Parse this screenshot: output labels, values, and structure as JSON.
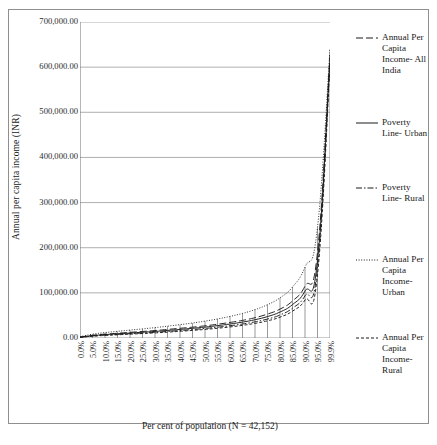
{
  "chart_data": {
    "type": "line",
    "title": "",
    "xlabel": "Per cent of population (N = 42,152)",
    "ylabel": "Annual per capita income (INR)",
    "ylim": [
      0,
      700000
    ],
    "yticks": [
      0,
      100000,
      200000,
      300000,
      400000,
      500000,
      600000,
      700000
    ],
    "ytick_labels": [
      "0.00",
      "100,000.00",
      "200,000.00",
      "300,000.00",
      "400,000.00",
      "500,000.00",
      "600,000.00",
      "700,000.00"
    ],
    "grid": true,
    "legend_position": "right",
    "x": [
      0.0,
      5.0,
      10.0,
      15.0,
      20.0,
      25.0,
      30.0,
      35.0,
      40.0,
      45.0,
      50.0,
      55.0,
      60.0,
      65.0,
      70.0,
      75.0,
      80.0,
      85.0,
      90.0,
      95.0,
      99.9
    ],
    "categories": [
      "0.0%",
      "5.0%",
      "10.0%",
      "15.0%",
      "20.0%",
      "25.0%",
      "30.0%",
      "35.0%",
      "40.0%",
      "45.0%",
      "50.0%",
      "55.0%",
      "60.0%",
      "65.0%",
      "70.0%",
      "75.0%",
      "80.0%",
      "85.0%",
      "90.0%",
      "95.0%",
      "99.9%"
    ],
    "series": [
      {
        "name": "Annual Per Capita Income- All India",
        "legend_label": "Annual Per Capita Income- All India",
        "style": "dashed-long",
        "values": [
          2000,
          6000,
          8500,
          10500,
          12500,
          14500,
          16500,
          19000,
          21500,
          24000,
          27000,
          30500,
          34500,
          39000,
          45000,
          53000,
          64000,
          82000,
          115000,
          190000,
          628000
        ]
      },
      {
        "name": "Poverty Line- Urban",
        "legend_label": "Poverty Line- Urban",
        "style": "solid",
        "values": [
          1800,
          5200,
          7500,
          9300,
          11000,
          12800,
          14600,
          16800,
          19000,
          21500,
          24200,
          27400,
          31000,
          35200,
          40500,
          47500,
          57500,
          74000,
          104000,
          172000,
          620000
        ]
      },
      {
        "name": "Poverty Line- Rural",
        "legend_label": "Poverty Line- Rural",
        "style": "dash-dot",
        "values": [
          1500,
          4400,
          6400,
          8000,
          9500,
          11000,
          12600,
          14500,
          16500,
          18700,
          21200,
          24000,
          27200,
          31000,
          35800,
          42000,
          51000,
          66000,
          93500,
          156000,
          612000
        ]
      },
      {
        "name": "Annual Per Capita Income- Urban",
        "legend_label": "Annual Per Capita Income- Urban",
        "style": "dotted",
        "values": [
          3000,
          8500,
          12000,
          14800,
          17500,
          20200,
          23000,
          26200,
          29600,
          33200,
          37400,
          42200,
          47800,
          54500,
          62800,
          73800,
          89000,
          113000,
          157000,
          245000,
          640000
        ]
      },
      {
        "name": "Annual Per Capita Income- Rural",
        "legend_label": "Annual Per Capita Income- Rural",
        "style": "dashed-short",
        "values": [
          1300,
          3900,
          5700,
          7100,
          8500,
          9900,
          11300,
          13000,
          14800,
          16800,
          19000,
          21600,
          24500,
          28000,
          32400,
          38000,
          46200,
          59500,
          84000,
          140000,
          605000
        ]
      }
    ]
  },
  "legend": {
    "entries": [
      {
        "label": "Annual Per Capita Income- All India",
        "style": "dashed-long"
      },
      {
        "label": "Poverty Line- Urban",
        "style": "solid"
      },
      {
        "label": "Poverty Line- Rural",
        "style": "dash-dot"
      },
      {
        "label": "Annual Per Capita Income- Urban",
        "style": "dotted"
      },
      {
        "label": "Annual Per Capita Income- Rural",
        "style": "dashed-short"
      }
    ]
  },
  "colors": {
    "axis": "#6f6f6f",
    "grid": "#9a9a9a",
    "line": "#1a1a1a",
    "frame": "#8f8f8f",
    "text": "#1a1a1a",
    "background": "#ffffff"
  }
}
